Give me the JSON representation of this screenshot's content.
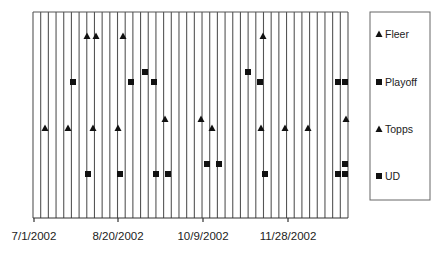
{
  "chart_data": {
    "type": "scatter",
    "title": "",
    "xlabel": "",
    "ylabel": "",
    "x_axis": {
      "type": "date",
      "tick_labels": [
        "7/1/2002",
        "8/20/2002",
        "10/9/2002",
        "11/28/2002"
      ],
      "range": [
        "7/1/2002",
        "1/3/2003"
      ]
    },
    "y_axis": {
      "visible": false,
      "range": [
        0,
        10
      ]
    },
    "grid": {
      "vertical_lines": true,
      "horizontal_lines": false,
      "vertical_line_count": 42
    },
    "legend": {
      "position": "right",
      "entries": [
        "Fleer",
        "Playoff",
        "Topps",
        "UD"
      ]
    },
    "series": [
      {
        "name": "Fleer",
        "marker": "triangle",
        "points": [
          {
            "date": "7/31/2002",
            "y": 8.8
          },
          {
            "date": "8/5/2002",
            "y": 8.8
          },
          {
            "date": "8/22/2002",
            "y": 8.8
          },
          {
            "date": "11/12/2002",
            "y": 8.8
          }
        ]
      },
      {
        "name": "Playoff",
        "marker": "square",
        "points": [
          {
            "date": "7/23/2002",
            "y": 6.5
          },
          {
            "date": "8/26/2002",
            "y": 6.5
          },
          {
            "date": "9/3/2002",
            "y": 7.0
          },
          {
            "date": "9/8/2002",
            "y": 6.5
          },
          {
            "date": "11/3/2002",
            "y": 7.0
          },
          {
            "date": "11/10/2002",
            "y": 6.5
          },
          {
            "date": "12/26/2002",
            "y": 6.5
          },
          {
            "date": "12/30/2002",
            "y": 6.5
          }
        ]
      },
      {
        "name": "Topps",
        "marker": "triangle",
        "points": [
          {
            "date": "7/7/2002",
            "y": 4.3
          },
          {
            "date": "7/20/2002",
            "y": 4.3
          },
          {
            "date": "8/4/2002",
            "y": 4.3
          },
          {
            "date": "8/19/2002",
            "y": 4.3
          },
          {
            "date": "9/15/2002",
            "y": 4.7
          },
          {
            "date": "10/6/2002",
            "y": 4.7
          },
          {
            "date": "10/13/2002",
            "y": 4.3
          },
          {
            "date": "11/11/2002",
            "y": 4.3
          },
          {
            "date": "11/25/2002",
            "y": 4.3
          },
          {
            "date": "12/9/2002",
            "y": 4.3
          },
          {
            "date": "12/31/2002",
            "y": 4.7
          }
        ]
      },
      {
        "name": "UD",
        "marker": "square",
        "points": [
          {
            "date": "7/31/2002",
            "y": 2.1
          },
          {
            "date": "8/20/2002",
            "y": 2.1
          },
          {
            "date": "9/10/2002",
            "y": 2.1
          },
          {
            "date": "9/17/2002",
            "y": 2.1
          },
          {
            "date": "10/9/2002",
            "y": 2.6
          },
          {
            "date": "10/16/2002",
            "y": 2.6
          },
          {
            "date": "11/13/2002",
            "y": 2.1
          },
          {
            "date": "12/26/2002",
            "y": 2.1
          },
          {
            "date": "12/30/2002",
            "y": 2.6
          },
          {
            "date": "12/30/2002",
            "y": 2.1
          }
        ]
      }
    ]
  },
  "render": {
    "plot": {
      "left": 33,
      "right": 348,
      "top": 12,
      "bottom": 218
    },
    "axis_y": 218,
    "ticks_x": [
      34,
      118,
      203,
      288
    ],
    "legend_box": {
      "x": 370,
      "y": 12,
      "w": 60,
      "h": 188
    },
    "legend_rows_y": [
      34,
      82,
      129,
      176
    ],
    "colors": {
      "grid": "#555555",
      "marker": "#111111",
      "border": "#666666"
    },
    "markers": {
      "Fleer": [
        [
          87,
          36
        ],
        [
          96,
          36
        ],
        [
          123,
          36
        ],
        [
          263,
          36
        ]
      ],
      "Playoff": [
        [
          73,
          82
        ],
        [
          131,
          82
        ],
        [
          145,
          72
        ],
        [
          154,
          82
        ],
        [
          248,
          72
        ],
        [
          260,
          82
        ],
        [
          338,
          82
        ],
        [
          345,
          82
        ]
      ],
      "Topps": [
        [
          45,
          128
        ],
        [
          68,
          128
        ],
        [
          93,
          128
        ],
        [
          118,
          128
        ],
        [
          165,
          119
        ],
        [
          201,
          119
        ],
        [
          212,
          128
        ],
        [
          261,
          128
        ],
        [
          285,
          128
        ],
        [
          308,
          128
        ],
        [
          346,
          119
        ]
      ],
      "UD": [
        [
          88,
          174
        ],
        [
          120,
          174
        ],
        [
          156,
          174
        ],
        [
          168,
          174
        ],
        [
          207,
          164
        ],
        [
          219,
          164
        ],
        [
          265,
          174
        ],
        [
          338,
          174
        ],
        [
          345,
          164
        ],
        [
          345,
          174
        ]
      ]
    }
  }
}
